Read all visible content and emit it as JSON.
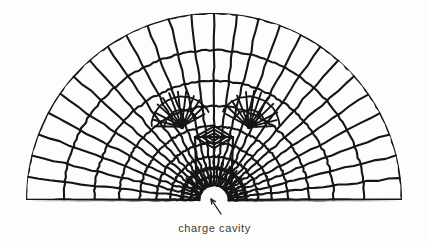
{
  "figure": {
    "background_color": "#fdfdfc",
    "line_color": "#151515",
    "caption": "charge cavity",
    "caption_color": "#3a3a38",
    "caption_x": 214,
    "caption_y": 222
  },
  "geometry": {
    "type": "radial-quad-mesh",
    "domain": "half-disk",
    "center_x": 214,
    "baseline_y": 200,
    "outer_radius_x": 188,
    "outer_radius_y": 187,
    "left_edge_x": 23,
    "right_edge_x": 399,
    "top_y": 13,
    "cavity": {
      "label": "charge cavity",
      "shape": "semicircle",
      "center_x": 214,
      "center_y": 200,
      "radius": 15
    },
    "rings": 9,
    "sectors": 26,
    "fan_nodes": [
      {
        "name": "left-fan-singularity",
        "x": 182,
        "y": 127,
        "spokes": 11,
        "start_angle": 182,
        "end_angle": 330
      },
      {
        "name": "right-fan-singularity",
        "x": 249,
        "y": 127,
        "spokes": 11,
        "start_angle": 210,
        "end_angle": 358
      }
    ],
    "center_rosette": {
      "name": "center-diamond-rosette",
      "x": 214,
      "y": 137,
      "half_width": 19,
      "half_height": 11
    }
  },
  "annotation": {
    "arrow": {
      "name": "cavity-arrow",
      "tail_x": 221,
      "tail_y": 214,
      "head_x": 211,
      "head_y": 199,
      "color": "#1a1a1a"
    }
  },
  "chart_data": {
    "type": "diagram",
    "title": "charge cavity"
  }
}
